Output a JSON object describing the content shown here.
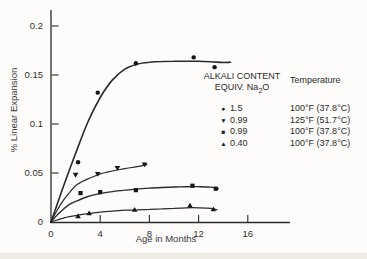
{
  "colors": {
    "ink": "#2b2b2b",
    "paper": "#fdfcfa",
    "scan_band": "#ebe7e1"
  },
  "legend": {
    "col1_header_line1": "ALKALI CONTENT",
    "col1_header_line2_prefix": "EQUIV. Na",
    "col1_header_line2_sub": "2",
    "col1_header_line2_suffix": "O",
    "col2_header": "Temperature",
    "rows": [
      {
        "marker": "circle-marker",
        "glyph": "●",
        "alkali": "1.5",
        "temperature": "100°F (37.8°C)"
      },
      {
        "marker": "triangle-down-marker",
        "glyph": "▼",
        "alkali": "0.99",
        "temperature": "125°F (51.7°C)"
      },
      {
        "marker": "square-marker",
        "glyph": "■",
        "alkali": "0.99",
        "temperature": "100°F (37.8°C)"
      },
      {
        "marker": "triangle-up-marker",
        "glyph": "▲",
        "alkali": "0.40",
        "temperature": "100°F (37.8°C)"
      }
    ]
  },
  "chart_data": {
    "type": "line",
    "title": "",
    "xlabel": "Age in Months",
    "ylabel": "% Linear Expansion",
    "xlim": [
      0,
      19.4
    ],
    "ylim": [
      0,
      0.215
    ],
    "grid": false,
    "legend_position": "right-inside",
    "xticks": [
      0,
      4,
      8,
      12,
      16
    ],
    "xtick_labels": [
      "0",
      "4",
      "8",
      "12",
      "16"
    ],
    "yticks": [
      0,
      0.05,
      0.1,
      0.15,
      0.2
    ],
    "ytick_labels": [
      "0",
      "0.05",
      "0.1",
      "0.15",
      "0.2"
    ],
    "series": [
      {
        "name": "Alkali 1.5 — 100°F (37.8°C)",
        "marker": "circle",
        "points": [
          [
            2.2,
            0.061
          ],
          [
            3.8,
            0.132
          ],
          [
            6.9,
            0.162
          ],
          [
            11.6,
            0.168
          ],
          [
            13.3,
            0.158
          ]
        ],
        "trend": [
          [
            0,
            0
          ],
          [
            0.5,
            0.018
          ],
          [
            1,
            0.036
          ],
          [
            2,
            0.07
          ],
          [
            3,
            0.102
          ],
          [
            4,
            0.127
          ],
          [
            5,
            0.145
          ],
          [
            6,
            0.156
          ],
          [
            7,
            0.161
          ],
          [
            8,
            0.163
          ],
          [
            9,
            0.1638
          ],
          [
            10,
            0.164
          ],
          [
            11,
            0.164
          ],
          [
            12,
            0.164
          ],
          [
            13,
            0.1635
          ],
          [
            14,
            0.1628
          ],
          [
            14.6,
            0.163
          ]
        ]
      },
      {
        "name": "Alkali 0.99 — 125°F (51.7°C)",
        "marker": "triangle-down",
        "points": [
          [
            2.0,
            0.048
          ],
          [
            3.8,
            0.049
          ],
          [
            5.4,
            0.055
          ],
          [
            7.6,
            0.0585
          ]
        ],
        "trend": [
          [
            0,
            0
          ],
          [
            0.5,
            0.012
          ],
          [
            1,
            0.022
          ],
          [
            1.5,
            0.03
          ],
          [
            2,
            0.037
          ],
          [
            2.5,
            0.041
          ],
          [
            3,
            0.044
          ],
          [
            4,
            0.049
          ],
          [
            5,
            0.052
          ],
          [
            6,
            0.0545
          ],
          [
            7,
            0.0565
          ],
          [
            7.8,
            0.0585
          ]
        ]
      },
      {
        "name": "Alkali 0.99 — 100°F (37.8°C)",
        "marker": "square",
        "points": [
          [
            2.4,
            0.0295
          ],
          [
            4.0,
            0.0305
          ],
          [
            6.9,
            0.0325
          ],
          [
            11.5,
            0.037
          ],
          [
            13.4,
            0.034
          ]
        ],
        "trend": [
          [
            0,
            0
          ],
          [
            0.5,
            0.007
          ],
          [
            1,
            0.013
          ],
          [
            1.5,
            0.018
          ],
          [
            2,
            0.021
          ],
          [
            3,
            0.026
          ],
          [
            4,
            0.029
          ],
          [
            5,
            0.031
          ],
          [
            6,
            0.0325
          ],
          [
            7,
            0.0335
          ],
          [
            8,
            0.0345
          ],
          [
            9,
            0.0352
          ],
          [
            10,
            0.0357
          ],
          [
            11,
            0.036
          ],
          [
            12,
            0.036
          ],
          [
            13,
            0.0355
          ],
          [
            13.6,
            0.034
          ]
        ]
      },
      {
        "name": "Alkali 0.40 — 100°F (37.8°C)",
        "marker": "triangle-up",
        "points": [
          [
            2.2,
            0.006
          ],
          [
            3.1,
            0.009
          ],
          [
            6.8,
            0.0125
          ],
          [
            11.3,
            0.017
          ],
          [
            13.2,
            0.013
          ]
        ],
        "trend": [
          [
            0,
            0
          ],
          [
            0.5,
            0.002
          ],
          [
            1,
            0.004
          ],
          [
            2,
            0.0065
          ],
          [
            3,
            0.0085
          ],
          [
            4,
            0.01
          ],
          [
            5,
            0.011
          ],
          [
            6,
            0.012
          ],
          [
            7,
            0.0125
          ],
          [
            8,
            0.013
          ],
          [
            9,
            0.0135
          ],
          [
            10,
            0.014
          ],
          [
            11,
            0.0145
          ],
          [
            12,
            0.0145
          ],
          [
            13,
            0.014
          ],
          [
            13.5,
            0.0125
          ]
        ]
      }
    ]
  }
}
